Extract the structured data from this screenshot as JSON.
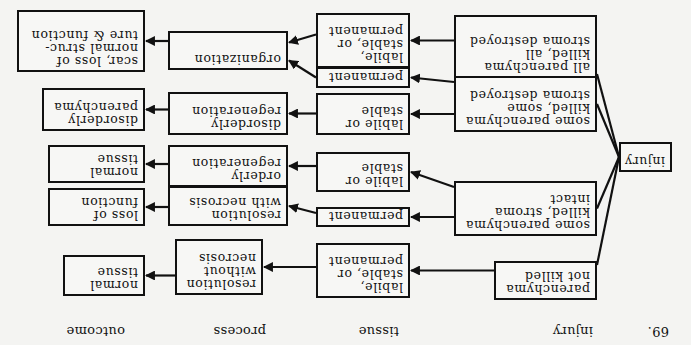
{
  "figure_number": "69.",
  "column_headers": {
    "injury": "injury",
    "tissue": "tissue",
    "process": "process",
    "outcome": "outcome"
  },
  "root": {
    "label": "injury"
  },
  "injury_nodes": [
    {
      "id": "i1",
      "label": "parenchyma\nnot killed"
    },
    {
      "id": "i2",
      "label": "some parenchyma\nkilled, stroma\nintact"
    },
    {
      "id": "i3",
      "label": "some parenchyma\nkilled, some\nstroma destroyed"
    },
    {
      "id": "i4",
      "label": "all parenchyma\nkilled, all\nstroma destroyed"
    }
  ],
  "tissue_nodes": [
    {
      "id": "t1",
      "label": "labile,\nstable, or\npermanent"
    },
    {
      "id": "t2",
      "label": "permanent"
    },
    {
      "id": "t3",
      "label": "labile or\nstable"
    },
    {
      "id": "t4",
      "label": "labile or\nstable"
    },
    {
      "id": "t5",
      "label": "permanent"
    },
    {
      "id": "t6",
      "label": "labile,\nstable, or\npermanent"
    }
  ],
  "process_nodes": [
    {
      "id": "p1",
      "label": "resolution\nwithout\nnecrosis"
    },
    {
      "id": "p2",
      "label": "resolution\nwith necrosis"
    },
    {
      "id": "p3",
      "label": "orderly\nregeneration"
    },
    {
      "id": "p4",
      "label": "disorderly\nregeneration"
    },
    {
      "id": "p5",
      "label": "organization"
    }
  ],
  "outcome_nodes": [
    {
      "id": "o1",
      "label": "normal\ntissue"
    },
    {
      "id": "o2",
      "label": "loss of\nfunction"
    },
    {
      "id": "o3",
      "label": "normal\ntissue"
    },
    {
      "id": "o4",
      "label": "disorderly\nparenchyma"
    },
    {
      "id": "o5",
      "label": "scar, loss of\nnormal struc-\nture & function"
    }
  ],
  "edges": [
    [
      "root",
      "i1"
    ],
    [
      "root",
      "i2"
    ],
    [
      "root",
      "i3"
    ],
    [
      "root",
      "i4"
    ],
    [
      "i1",
      "t1"
    ],
    [
      "i2",
      "t2"
    ],
    [
      "i2",
      "t3"
    ],
    [
      "i3",
      "t4"
    ],
    [
      "i3",
      "t5"
    ],
    [
      "i4",
      "t6"
    ],
    [
      "t1",
      "p1"
    ],
    [
      "t2",
      "p2"
    ],
    [
      "t3",
      "p3"
    ],
    [
      "t4",
      "p4"
    ],
    [
      "t5",
      "p5"
    ],
    [
      "t6",
      "p5"
    ],
    [
      "p1",
      "o1"
    ],
    [
      "p2",
      "o2"
    ],
    [
      "p3",
      "o3"
    ],
    [
      "p4",
      "o4"
    ],
    [
      "p5",
      "o5"
    ]
  ]
}
